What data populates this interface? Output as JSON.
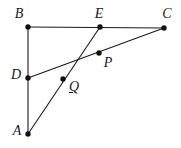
{
  "figure": {
    "width": 181,
    "height": 148,
    "background_color": "#ffffff",
    "stroke_color": "#1a1a1a",
    "vertex_fill_color": "#111111"
  },
  "points": [
    {
      "id": "A",
      "label": "A",
      "x": 28,
      "y": 134,
      "label_x": 17,
      "label_y": 131,
      "underlined": false
    },
    {
      "id": "B",
      "label": "B",
      "x": 28,
      "y": 27,
      "label_x": 19,
      "label_y": 14,
      "underlined": false
    },
    {
      "id": "C",
      "label": "C",
      "x": 164,
      "y": 28,
      "label_x": 167,
      "label_y": 14,
      "underlined": false
    },
    {
      "id": "D",
      "label": "D",
      "x": 28,
      "y": 78,
      "label_x": 16,
      "label_y": 75,
      "underlined": false
    },
    {
      "id": "E",
      "label": "E",
      "x": 100,
      "y": 27,
      "label_x": 99,
      "label_y": 14,
      "underlined": false
    },
    {
      "id": "P",
      "label": "P",
      "x": 99,
      "y": 53,
      "label_x": 108,
      "label_y": 63,
      "underlined": false
    },
    {
      "id": "Q",
      "label": "Q",
      "x": 63,
      "y": 79,
      "label_x": 74,
      "label_y": 87,
      "underlined": true
    }
  ],
  "segments": [
    {
      "id": "BC",
      "from": "B",
      "to": "C",
      "description": "top horizontal side B to C through E"
    },
    {
      "id": "AB",
      "from": "A",
      "to": "B",
      "description": "left vertical side A to B through D"
    },
    {
      "id": "AE",
      "from": "A",
      "to": "E",
      "description": "cevian from A to E through Q"
    },
    {
      "id": "DC",
      "from": "D",
      "to": "C",
      "description": "cevian from D to C through Q and P"
    }
  ],
  "vertex_dot_radius": 2.6
}
